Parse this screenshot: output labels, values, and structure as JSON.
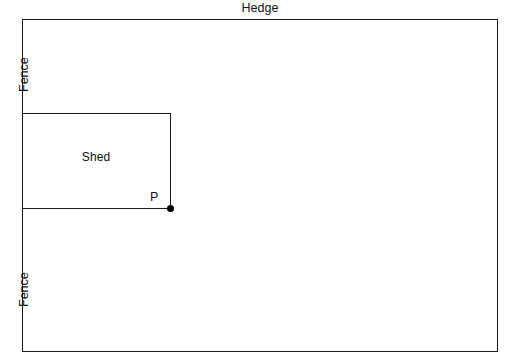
{
  "diagram": {
    "width": 507,
    "height": 364,
    "stroke_color": "#1a1a1a",
    "background_color": "#ffffff"
  },
  "boundaries": {
    "top_label": "Hedge",
    "left_label_upper": "Fence",
    "left_label_lower": "Fence",
    "right_label": "Rail"
  },
  "shed": {
    "label": "Shed"
  },
  "point": {
    "label": "P"
  }
}
